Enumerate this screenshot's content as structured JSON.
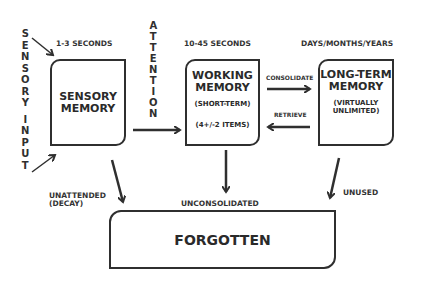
{
  "diagram": {
    "sensory_input": {
      "label": "SENSORY INPUT",
      "letters_top": [
        "S",
        "E",
        "N",
        "S",
        "O",
        "R",
        "Y"
      ],
      "letters_bottom": [
        "I",
        "N",
        "P",
        "U",
        "T"
      ]
    },
    "attention": {
      "label": "ATTENTION",
      "letters": [
        "A",
        "T",
        "T",
        "E",
        "N",
        "T",
        "I",
        "O",
        "N"
      ]
    },
    "durations": {
      "sensory": "1-3 SECONDS",
      "working": "10-45 SECONDS",
      "long_term": "DAYS/MONTHS/YEARS"
    },
    "boxes": {
      "sensory": {
        "title_line1": "SENSORY",
        "title_line2": "MEMORY"
      },
      "working": {
        "title_line1": "WORKING",
        "title_line2": "MEMORY",
        "sub1": "(SHORT-TERM)",
        "sub2": "(4+/-2 ITEMS)"
      },
      "long_term": {
        "title_line1": "LONG-TERM",
        "title_line2": "MEMORY",
        "sub1": "(VIRTUALLY",
        "sub2": "UNLIMITED)"
      },
      "forgotten": {
        "title": "FORGOTTEN"
      }
    },
    "arrows": {
      "consolidate": "CONSOLIDATE",
      "retrieve": "RETRIEVE",
      "unattended_line1": "UNATTENDED",
      "unattended_line2": "(DECAY)",
      "unconsolidated": "UNCONSOLIDATED",
      "unused": "UNUSED"
    },
    "colors": {
      "stroke": "#2f2f2f",
      "background": "#ffffff"
    }
  }
}
